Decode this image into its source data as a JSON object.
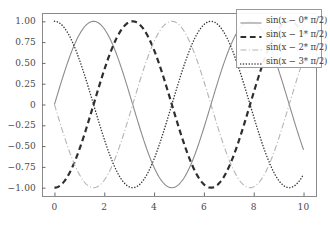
{
  "chart_data": {
    "type": "line",
    "title": "",
    "xlabel": "",
    "ylabel": "",
    "xlim": [
      -0.5,
      10.5
    ],
    "ylim": [
      -1.1,
      1.1
    ],
    "xticks": [
      "0",
      "2",
      "4",
      "6",
      "8",
      "10"
    ],
    "xtick_values": [
      0,
      2,
      4,
      6,
      8,
      10
    ],
    "yticks": [
      "1.00",
      "0.75",
      "0.50",
      "0.25",
      "0",
      "-0.25",
      "-0.50",
      "-0.75",
      "-1.00"
    ],
    "ytick_values": [
      1.0,
      0.75,
      0.5,
      0.25,
      0,
      -0.25,
      -0.5,
      -0.75,
      -1.0
    ],
    "grid": false,
    "legend_position": "upper right",
    "series": [
      {
        "name": "sin(x − 0* π/2)",
        "phase": 0,
        "linestyle": "solid",
        "color": "#8c8c8c",
        "linewidth": 1.1,
        "x": [
          0,
          0.5,
          1.0,
          1.5708,
          2.0,
          2.5,
          3.1416,
          3.5,
          4.0,
          4.7124,
          5.0,
          5.5,
          6.2832,
          6.5,
          7.0,
          7.854,
          8.0,
          8.5,
          9.0,
          9.4248,
          10.0
        ],
        "y": [
          0,
          0.479,
          0.841,
          1.0,
          0.909,
          0.599,
          0,
          -0.351,
          -0.757,
          -1.0,
          -0.959,
          -0.706,
          0,
          0.215,
          0.657,
          1.0,
          0.989,
          0.798,
          0.412,
          0,
          -0.544
        ]
      },
      {
        "name": "sin(x − 1* π/2)",
        "phase": 1.5708,
        "linestyle": "dashed",
        "color": "#2e2e2e",
        "linewidth": 2.2,
        "x": [
          0,
          0.5,
          1.0,
          1.5708,
          2.0,
          2.5,
          3.1416,
          3.5,
          4.0,
          4.7124,
          5.0,
          5.5,
          6.2832,
          6.5,
          7.0,
          7.854,
          8.0,
          8.5,
          9.0,
          9.4248,
          10.0
        ],
        "y": [
          -1.0,
          -0.878,
          -0.54,
          0,
          0.416,
          0.801,
          1.0,
          0.936,
          0.654,
          0,
          -0.284,
          -0.709,
          -1.0,
          -0.977,
          -0.754,
          0,
          0.146,
          0.602,
          0.911,
          1.0,
          0.839
        ]
      },
      {
        "name": "sin(x − 2* π/2)",
        "phase": 3.1416,
        "linestyle": "dashdot",
        "color": "#b4b4b4",
        "linewidth": 1.1,
        "x": [
          0,
          0.5,
          1.0,
          1.5708,
          2.0,
          2.5,
          3.1416,
          3.5,
          4.0,
          4.7124,
          5.0,
          5.5,
          6.2832,
          6.5,
          7.0,
          7.854,
          8.0,
          8.5,
          9.0,
          9.4248,
          10.0
        ],
        "y": [
          0,
          -0.479,
          -0.841,
          -1.0,
          -0.909,
          -0.599,
          0,
          0.351,
          0.757,
          1.0,
          0.959,
          0.706,
          0,
          -0.215,
          -0.657,
          -1.0,
          -0.989,
          -0.798,
          -0.412,
          0,
          0.544
        ]
      },
      {
        "name": "sin(x − 3* π/2)",
        "phase": 4.7124,
        "linestyle": "dotted",
        "color": "#3a3a3a",
        "linewidth": 1.5,
        "x": [
          0,
          0.5,
          1.0,
          1.5708,
          2.0,
          2.5,
          3.1416,
          3.5,
          4.0,
          4.7124,
          5.0,
          5.5,
          6.2832,
          6.5,
          7.0,
          7.854,
          8.0,
          8.5,
          9.0,
          9.4248,
          10.0
        ],
        "y": [
          1.0,
          0.878,
          0.54,
          0,
          -0.416,
          -0.801,
          -1.0,
          -0.936,
          -0.654,
          0,
          0.284,
          0.709,
          1.0,
          0.977,
          0.754,
          0,
          -0.146,
          -0.602,
          -0.911,
          -1.0,
          -0.839
        ]
      }
    ]
  },
  "legend": {
    "entries": [
      {
        "label": "sin(x − 0* π/2)"
      },
      {
        "label": "sin(x − 1* π/2)"
      },
      {
        "label": "sin(x − 2* π/2)"
      },
      {
        "label": "sin(x − 3* π/2)"
      }
    ]
  },
  "axes": {
    "spine_color": "#8a8a8a",
    "tick_color": "#6a6a6a",
    "label_color": "#4a4a4a",
    "background": "#ffffff"
  }
}
